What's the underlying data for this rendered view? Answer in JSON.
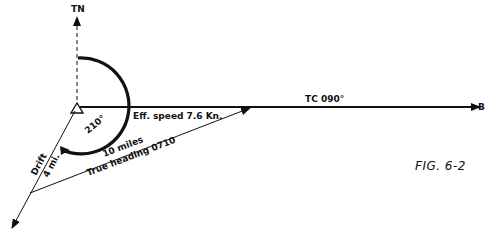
{
  "figure": {
    "caption": "FIG. 6-2",
    "labels": {
      "true_north": "TN",
      "true_course": "TC 090°",
      "destination": "B",
      "effective_speed": "Eff. speed 7.6 Kn.",
      "angle": "210°",
      "drift": "Drift",
      "drift_distance": "4 mi.",
      "distance": "10 miles",
      "true_heading": "True heading 0710"
    }
  },
  "colors": {
    "ink": "#111111",
    "background": "#ffffff"
  }
}
